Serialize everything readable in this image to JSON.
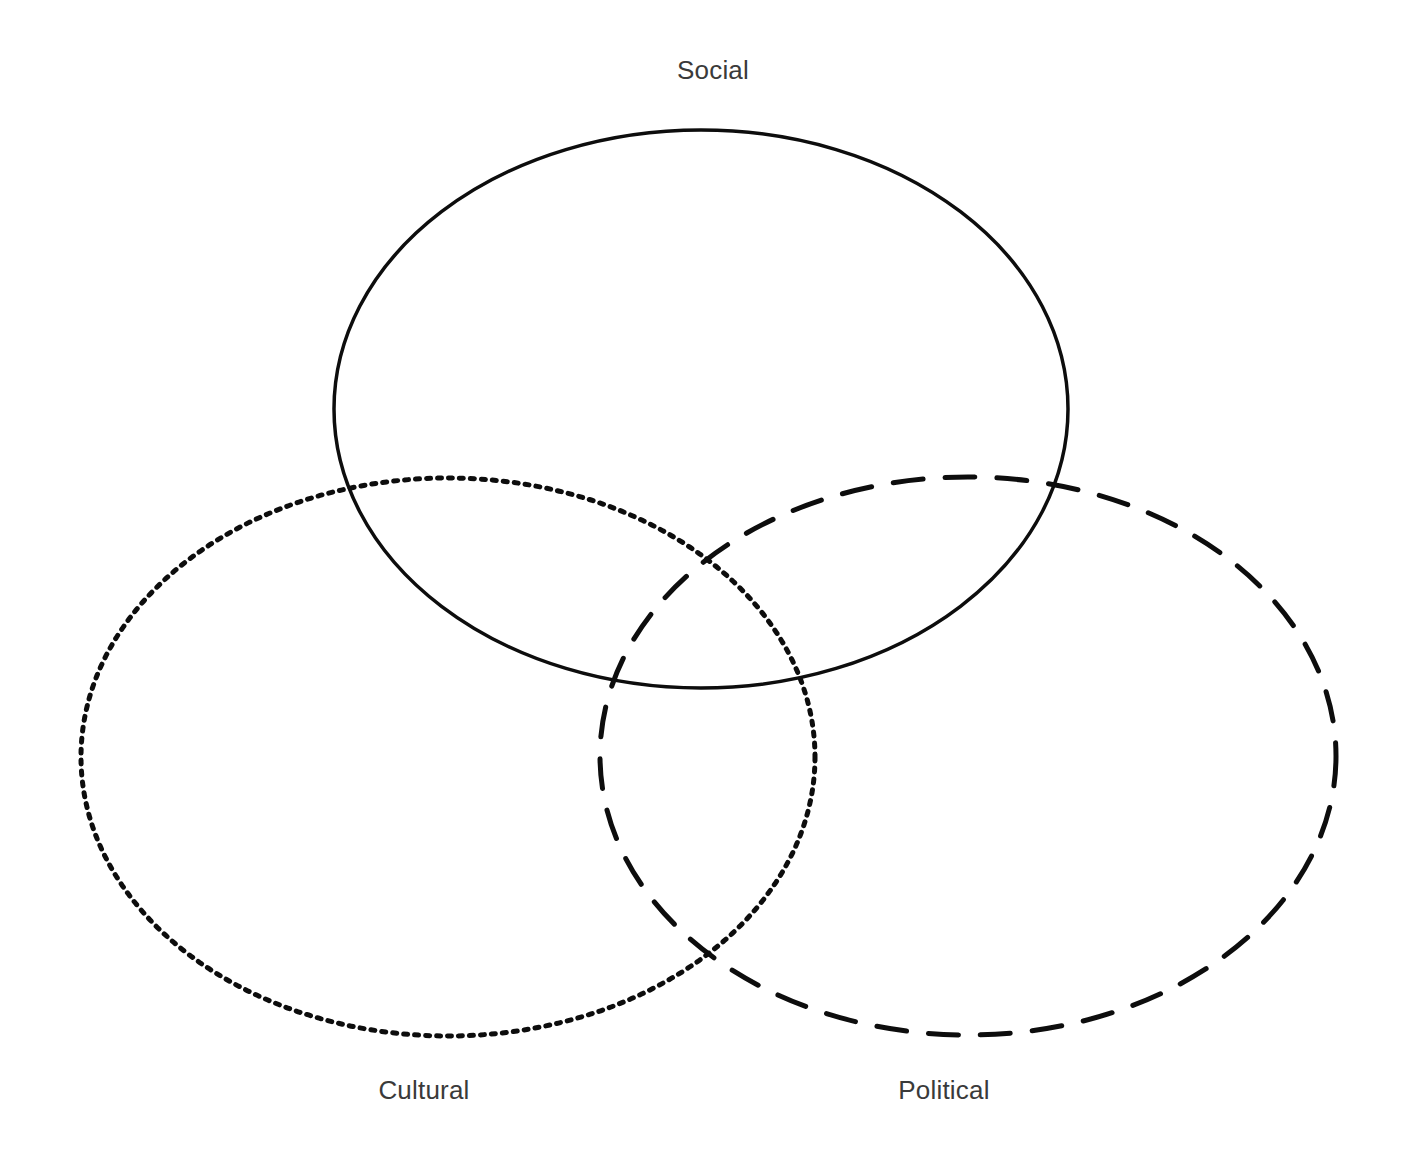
{
  "canvas": {
    "width": 1404,
    "height": 1151,
    "background_color": "#ffffff"
  },
  "chart_data": {
    "type": "diagram",
    "diagram_type": "venn",
    "title": "",
    "set_count": 3,
    "stroke_color": "#0d0d0d",
    "fill": "none",
    "label_color": "#3a3a3a",
    "sets": [
      {
        "id": "social",
        "label": "Social",
        "line_style": "solid",
        "stroke_width": 3.5,
        "dash_pattern": "",
        "cx": 701,
        "cy": 409,
        "rx": 367,
        "ry": 279,
        "label_x": 713,
        "label_y": 57,
        "label_position": "top"
      },
      {
        "id": "cultural",
        "label": "Cultural",
        "line_style": "dotted",
        "stroke_width": 5,
        "dash_pattern": "4 7",
        "cx": 448,
        "cy": 757,
        "rx": 367,
        "ry": 279,
        "label_x": 424,
        "label_y": 1077,
        "label_position": "bottom-left"
      },
      {
        "id": "political",
        "label": "Political",
        "line_style": "dashed",
        "stroke_width": 5,
        "dash_pattern": "30 22",
        "cx": 968,
        "cy": 756,
        "rx": 368,
        "ry": 279,
        "label_x": 944,
        "label_y": 1077,
        "label_position": "bottom-right"
      }
    ],
    "intersections": [
      {
        "sets": [
          "social",
          "cultural"
        ],
        "label": ""
      },
      {
        "sets": [
          "social",
          "political"
        ],
        "label": ""
      },
      {
        "sets": [
          "cultural",
          "political"
        ],
        "label": ""
      },
      {
        "sets": [
          "social",
          "cultural",
          "political"
        ],
        "label": ""
      }
    ],
    "legend": null,
    "grid": false
  }
}
